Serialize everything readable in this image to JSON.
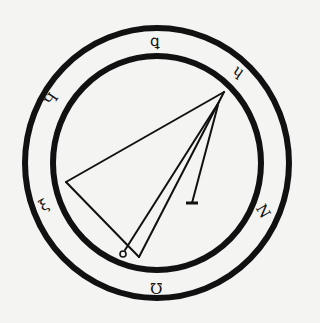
{
  "diagram": {
    "type": "seal",
    "background": "#f4f4f2",
    "ink": "#111111",
    "center": [
      157,
      163
    ],
    "rings": [
      {
        "name": "outer-ring",
        "rx": 132,
        "ry": 135,
        "stroke_width": 6
      },
      {
        "name": "inner-ring",
        "rx": 104,
        "ry": 107,
        "stroke_width": 6
      }
    ],
    "glyphs": [
      {
        "name": "glyph-top",
        "char": "ꝗ",
        "x": 150,
        "y": 34,
        "rotate": 0
      },
      {
        "name": "glyph-upper-right",
        "char": "ɥ",
        "x": 234,
        "y": 64,
        "rotate": 35
      },
      {
        "name": "glyph-upper-left",
        "char": "Ч",
        "x": 46,
        "y": 92,
        "rotate": -55
      },
      {
        "name": "glyph-lower-left",
        "char": "ξ",
        "x": 40,
        "y": 198,
        "rotate": -30
      },
      {
        "name": "glyph-lower-right",
        "char": "Ν",
        "x": 256,
        "y": 204,
        "rotate": 60
      },
      {
        "name": "glyph-bottom",
        "char": "Ω",
        "x": 150,
        "y": 280,
        "rotate": 180
      }
    ],
    "lines": [
      {
        "name": "apex-to-left-vertex",
        "x1": 224,
        "y1": 92,
        "x2": 66,
        "y2": 182
      },
      {
        "name": "left-vertex-to-bottom",
        "x1": 66,
        "y1": 182,
        "x2": 139,
        "y2": 257
      },
      {
        "name": "apex-to-bottom",
        "x1": 224,
        "y1": 92,
        "x2": 139,
        "y2": 257
      },
      {
        "name": "apex-to-small-circle",
        "x1": 219,
        "y1": 102,
        "x2": 125,
        "y2": 250
      },
      {
        "name": "apex-to-crossbar",
        "x1": 218,
        "y1": 105,
        "x2": 192,
        "y2": 203
      }
    ],
    "end_marks": [
      {
        "name": "small-circle",
        "type": "circle",
        "cx": 123,
        "cy": 254,
        "r": 3
      },
      {
        "name": "crossbar",
        "type": "bar",
        "x1": 186,
        "y1": 203,
        "x2": 198,
        "y2": 203
      }
    ]
  }
}
